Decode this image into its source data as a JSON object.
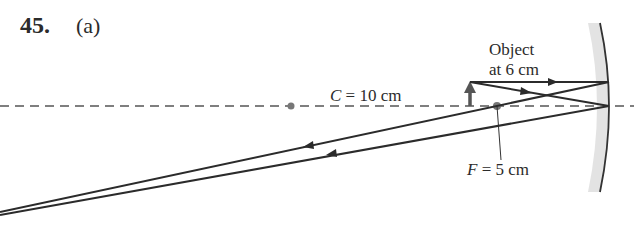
{
  "problem": {
    "number": "45.",
    "part": "(a)"
  },
  "labels": {
    "center": {
      "symbol": "C",
      "text": " = 10 cm"
    },
    "focal": {
      "symbol": "F",
      "text": " = 5 cm"
    },
    "object_line1": "Object",
    "object_line2": "at 6 cm"
  },
  "diagram": {
    "mirror_type": "concave mirror",
    "principal_axis": "dashed",
    "points": [
      {
        "name": "C",
        "distance_cm": 10
      },
      {
        "name": "F",
        "distance_cm": 5
      }
    ],
    "object_distance_cm": 6,
    "rays": [
      {
        "name": "parallel ray",
        "incident": "parallel to axis",
        "reflected": "through F, diverging left"
      },
      {
        "name": "vertex ray",
        "incident": "to mirror vertex",
        "reflected": "symmetric about axis, diverging left"
      }
    ],
    "colors": {
      "ray": "#2b2b2b",
      "axis": "#555555",
      "mirror_fill": "#d9d9d9",
      "object_arrow": "#555555"
    }
  }
}
